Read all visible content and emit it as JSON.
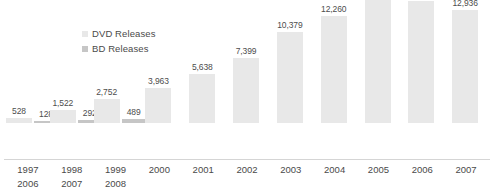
{
  "chart_data": {
    "type": "bar",
    "title": "",
    "subtitle": "",
    "xlabel": "",
    "ylabel": "",
    "grid": false,
    "legend_position": "top-left-inside",
    "ylim": [
      0,
      14036
    ],
    "categories": [
      "1997",
      "1998",
      "1999",
      "2000",
      "2001",
      "2002",
      "2003",
      "2004",
      "2005",
      "2006",
      "2007"
    ],
    "categories_row2": [
      "2006",
      "2007",
      "2008",
      "",
      "",
      "",
      "",
      "",
      "",
      "",
      ""
    ],
    "series": [
      {
        "name": "DVD Releases",
        "color": "#e8e8e8",
        "values": [
          528,
          1522,
          2752,
          3963,
          5638,
          7399,
          10379,
          12260,
          14036,
          13885,
          12936
        ],
        "labels": [
          "528",
          "1,522",
          "2,752",
          "3,963",
          "5,638",
          "7,399",
          "10,379",
          "12,260",
          "14,036",
          "13,885",
          "12,936"
        ]
      },
      {
        "name": "BD Releases",
        "color": "#c6c6c6",
        "values": [
          128,
          292,
          489,
          null,
          null,
          null,
          null,
          null,
          null,
          null,
          null
        ],
        "labels": [
          "128",
          "292",
          "489",
          "",
          "",
          "",
          "",
          "",
          "",
          "",
          ""
        ]
      }
    ]
  },
  "legend": {
    "items": [
      {
        "label": "DVD Releases",
        "color": "#e8e8e8"
      },
      {
        "label": "BD Releases",
        "color": "#c6c6c6"
      }
    ]
  }
}
